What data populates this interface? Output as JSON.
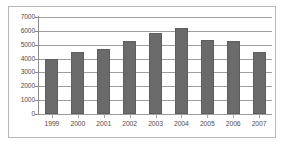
{
  "chart_data": {
    "type": "bar",
    "title": "",
    "subtitle": "",
    "xlabel": "",
    "ylabel": "",
    "categories": [
      "1999",
      "2000",
      "2001",
      "2002",
      "2003",
      "2004",
      "2005",
      "2006",
      "2007"
    ],
    "values": [
      4000,
      4450,
      4700,
      5250,
      5850,
      6200,
      5350,
      5300,
      4500
    ],
    "series": [
      {
        "name": "",
        "values": [
          4000,
          4450,
          4700,
          5250,
          5850,
          6200,
          5350,
          5300,
          4500
        ]
      }
    ],
    "ylim": [
      0,
      7000
    ],
    "ytick_values": [
      0,
      1000,
      2000,
      3000,
      4000,
      5000,
      6000,
      7000
    ],
    "ytick_labels": [
      "0",
      "1000",
      "2000",
      "3000",
      "4000",
      "5000",
      "6000",
      "7000"
    ],
    "grid": true,
    "grid_axis": "y",
    "legend": false,
    "legend_position": "none",
    "bar_color": "#6b6b6b",
    "bar_edge_color": "#5e5e5e",
    "gridline_color": "#9d9d9d",
    "axis_color": "#8a8a8a",
    "frame_color": "#b9b9b9",
    "background_color": "#ffffff",
    "tick_label_color": "#4d4d4d"
  }
}
